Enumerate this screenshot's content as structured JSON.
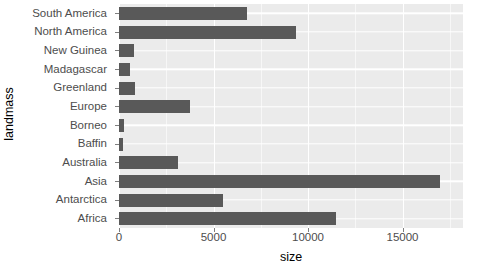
{
  "chart_data": {
    "type": "bar",
    "orientation": "horizontal",
    "title": "",
    "xlabel": "size",
    "ylabel": "landmass",
    "categories": [
      "South America",
      "North America",
      "New Guinea",
      "Madagascar",
      "Greenland",
      "Europe",
      "Borneo",
      "Baffin",
      "Australia",
      "Asia",
      "Antarctica",
      "Africa"
    ],
    "values": [
      6795,
      9390,
      786,
      587,
      840,
      3745,
      280,
      195,
      3115,
      16988,
      5500,
      11506
    ],
    "xlim": [
      0,
      18200
    ],
    "ylim": null,
    "x_ticks": [
      0,
      5000,
      10000,
      15000
    ],
    "x_tick_labels": [
      "0",
      "5000",
      "10000",
      "15000"
    ],
    "grid": true,
    "legend": null,
    "colors": {
      "bar": "#595959",
      "panel_background": "#ebebeb",
      "major_gridline": "#ffffff",
      "minor_gridline": "#f7f7f7",
      "axis_text": "#4d4d4d",
      "axis_title": "#000000",
      "plot_background": "#ffffff"
    }
  }
}
